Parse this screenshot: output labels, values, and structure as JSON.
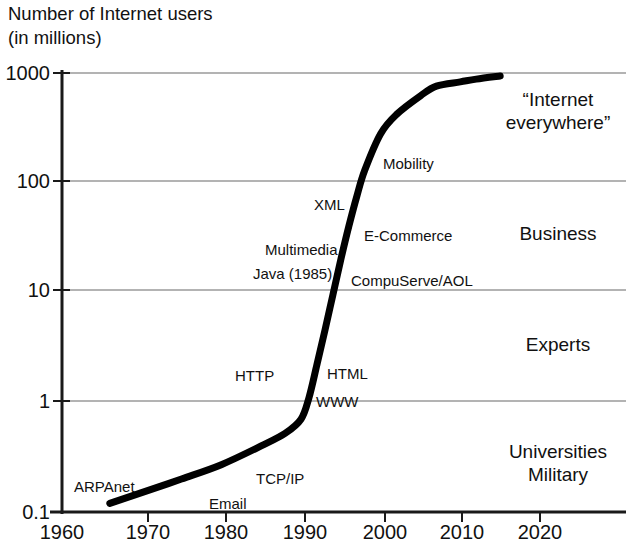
{
  "title": {
    "line1": "Number of Internet users",
    "line2": "(in millions)"
  },
  "chart_data": {
    "type": "line",
    "title": "Number of Internet users (in millions)",
    "xlabel": "",
    "ylabel": "Number of Internet users (in millions)",
    "yscale": "log",
    "xscale": "linear",
    "xlim": [
      1960,
      2025
    ],
    "ylim": [
      0.1,
      1000
    ],
    "grid": true,
    "legend": null,
    "xticks": [
      1960,
      1970,
      1980,
      1990,
      2000,
      2010,
      2020
    ],
    "xtick_labels": [
      "1960",
      "1970",
      "1980",
      "1990",
      "2000",
      "2010",
      "2020"
    ],
    "yticks": [
      0.1,
      1,
      10,
      100,
      1000
    ],
    "ytick_labels": [
      "0.1",
      "1",
      "10",
      "100",
      "1000"
    ],
    "series": [
      {
        "name": "Internet users",
        "x": [
          1966,
          1970,
          1975,
          1980,
          1985,
          1988,
          1990,
          1991,
          1992,
          1993,
          1994,
          1995,
          1996,
          1997,
          1998,
          2000,
          2002,
          2005,
          2007,
          2010,
          2012,
          2015
        ],
        "values": [
          0.12,
          0.15,
          0.2,
          0.27,
          0.4,
          0.52,
          0.7,
          1.1,
          2.2,
          4.5,
          9.5,
          20,
          40,
          75,
          130,
          280,
          420,
          620,
          760,
          830,
          880,
          940
        ]
      }
    ],
    "annotations": [
      {
        "label": "ARPAnet",
        "x": 1962,
        "y": 0.13
      },
      {
        "label": "Email",
        "x": 1976,
        "y": 0.105
      },
      {
        "label": "TCP/IP",
        "x": 1983,
        "y": 0.16
      },
      {
        "label": "WWW",
        "x": 1991,
        "y": 0.95
      },
      {
        "label": "HTTP",
        "x": 1987,
        "y": 1.75
      },
      {
        "label": "HTML",
        "x": 1992,
        "y": 1.9
      },
      {
        "label": "CompuServe/AOL",
        "x": 1993,
        "y": 9
      },
      {
        "label": "Java (1985)",
        "x": 1983,
        "y": 13
      },
      {
        "label": "Multimedia",
        "x": 1985,
        "y": 21
      },
      {
        "label": "E-Commerce",
        "x": 1994,
        "y": 33
      },
      {
        "label": "XML",
        "x": 1989,
        "y": 60
      },
      {
        "label": "Mobility",
        "x": 1996,
        "y": 150
      }
    ],
    "band_labels": [
      {
        "label": "“Internet everywhere”",
        "range": [
          100,
          1000
        ]
      },
      {
        "label": "Business",
        "range": [
          10,
          100
        ]
      },
      {
        "label": "Experts",
        "range": [
          1,
          10
        ]
      },
      {
        "label": "Universities Military",
        "range": [
          0.1,
          1
        ]
      }
    ]
  },
  "yticks": [
    {
      "label": "1000"
    },
    {
      "label": "100"
    },
    {
      "label": "10"
    },
    {
      "label": "1"
    },
    {
      "label": "0.1"
    }
  ],
  "xticks": [
    {
      "label": "1960"
    },
    {
      "label": "1970"
    },
    {
      "label": "1980"
    },
    {
      "label": "1990"
    },
    {
      "label": "2000"
    },
    {
      "label": "2010"
    },
    {
      "label": "2020"
    }
  ],
  "annotations": [
    {
      "label": "Mobility"
    },
    {
      "label": "XML"
    },
    {
      "label": "E-Commerce"
    },
    {
      "label": "Multimedia"
    },
    {
      "label": "Java (1985)"
    },
    {
      "label": "CompuServe/AOL"
    },
    {
      "label": "HTTP"
    },
    {
      "label": "HTML"
    },
    {
      "label": "WWW"
    },
    {
      "label": "TCP/IP"
    },
    {
      "label": "ARPAnet"
    },
    {
      "label": "Email"
    }
  ],
  "bands": [
    {
      "line1": "“Internet",
      "line2": "everywhere”"
    },
    {
      "line1": "Business",
      "line2": ""
    },
    {
      "line1": "Experts",
      "line2": ""
    },
    {
      "line1": "Universities",
      "line2": "Military"
    }
  ],
  "colors": {
    "curve": "#000000",
    "axis": "#1a1a1a",
    "grid": "#9a9a9a",
    "text": "#111111",
    "background": "#ffffff"
  }
}
